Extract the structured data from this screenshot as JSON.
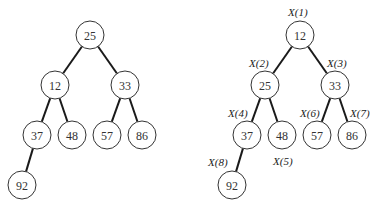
{
  "trees": [
    {
      "id": "heap-before",
      "nodes": [
        {
          "value": "25",
          "x": 90,
          "y": 35
        },
        {
          "value": "12",
          "x": 55,
          "y": 85
        },
        {
          "value": "33",
          "x": 125,
          "y": 85
        },
        {
          "value": "37",
          "x": 37,
          "y": 135
        },
        {
          "value": "48",
          "x": 72,
          "y": 135
        },
        {
          "value": "57",
          "x": 107,
          "y": 135
        },
        {
          "value": "86",
          "x": 142,
          "y": 135
        },
        {
          "value": "92",
          "x": 22,
          "y": 185
        }
      ],
      "edges": [
        [
          0,
          1
        ],
        [
          0,
          2
        ],
        [
          1,
          3
        ],
        [
          1,
          4
        ],
        [
          2,
          5
        ],
        [
          2,
          6
        ],
        [
          3,
          7
        ]
      ],
      "labels": []
    },
    {
      "id": "heap-after",
      "nodes": [
        {
          "value": "12",
          "x": 300,
          "y": 35
        },
        {
          "value": "25",
          "x": 265,
          "y": 85
        },
        {
          "value": "33",
          "x": 335,
          "y": 85
        },
        {
          "value": "37",
          "x": 247,
          "y": 135
        },
        {
          "value": "48",
          "x": 282,
          "y": 135
        },
        {
          "value": "57",
          "x": 317,
          "y": 135
        },
        {
          "value": "86",
          "x": 352,
          "y": 135
        },
        {
          "value": "92",
          "x": 232,
          "y": 185
        }
      ],
      "edges": [
        [
          0,
          1
        ],
        [
          0,
          2
        ],
        [
          1,
          3
        ],
        [
          1,
          4
        ],
        [
          2,
          5
        ],
        [
          2,
          6
        ],
        [
          3,
          7
        ]
      ],
      "labels": [
        {
          "text": "X(1)",
          "x": 288,
          "y": 16
        },
        {
          "text": "X(2)",
          "x": 249,
          "y": 67
        },
        {
          "text": "X(3)",
          "x": 327,
          "y": 67
        },
        {
          "text": "X(4)",
          "x": 228,
          "y": 117
        },
        {
          "text": "X(5)",
          "x": 273,
          "y": 165
        },
        {
          "text": "X(6)",
          "x": 300,
          "y": 117
        },
        {
          "text": "X(7)",
          "x": 350,
          "y": 117
        },
        {
          "text": "X(8)",
          "x": 208,
          "y": 166
        }
      ]
    }
  ],
  "node_radius": 14
}
